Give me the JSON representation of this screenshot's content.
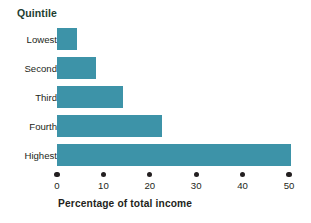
{
  "chart_data": {
    "type": "bar",
    "orientation": "horizontal",
    "title": "",
    "xlabel": "Percentage of total income",
    "ylabel": "Quintile",
    "categories": [
      "Lowest",
      "Second",
      "Third",
      "Fourth",
      "Highest"
    ],
    "values": [
      4.3,
      8.5,
      14.3,
      22.6,
      50.4
    ],
    "xlim": [
      0,
      50
    ],
    "xticks": [
      0,
      10,
      20,
      30,
      40,
      50
    ],
    "xtick_labels": [
      "0",
      "10",
      "20",
      "30",
      "40",
      "50"
    ],
    "grid": false,
    "legend": false,
    "bar_color": "#3d93a8",
    "axis_title_color": "#1d3d30",
    "text_color": "#231f20",
    "background": "#ffffff"
  }
}
